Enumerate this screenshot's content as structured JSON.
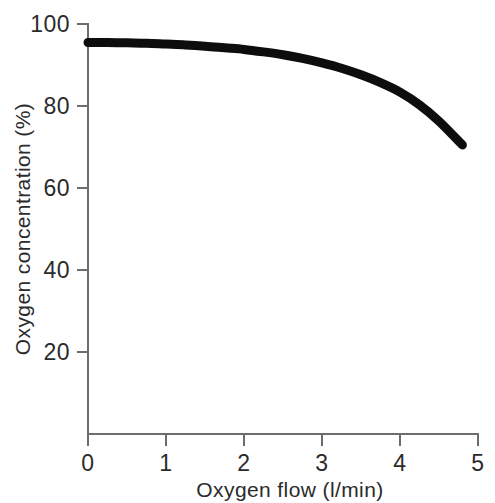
{
  "figure": {
    "background_color": "#ffffff",
    "axis_color": "#6d6d6d",
    "curve_color": "#0d0d0d"
  },
  "chart_data": {
    "type": "line",
    "title": "",
    "subtitle": "",
    "xlabel": "Oxygen flow (l/min)",
    "ylabel": "Oxygen concentration (%)",
    "xlim": [
      0,
      5
    ],
    "ylim": [
      0,
      100
    ],
    "xticks": [
      0,
      1,
      2,
      3,
      4,
      5
    ],
    "xtick_labels": [
      "0",
      "1",
      "2",
      "3",
      "4",
      "5"
    ],
    "yticks": [
      20,
      40,
      60,
      80,
      100
    ],
    "ytick_labels": [
      "20",
      "40",
      "60",
      "80",
      "100"
    ],
    "grid": false,
    "legend": null,
    "legend_position": "none",
    "annotations": [],
    "series": [
      {
        "name": "Oxygen concentration vs flow",
        "x": [
          0.0,
          0.25,
          0.5,
          0.75,
          1.0,
          1.25,
          1.5,
          1.75,
          2.0,
          2.25,
          2.5,
          2.75,
          3.0,
          3.25,
          3.5,
          3.75,
          4.0,
          4.25,
          4.5,
          4.8
        ],
        "values": [
          95.5,
          95.5,
          95.4,
          95.3,
          95.1,
          94.9,
          94.6,
          94.2,
          93.8,
          93.2,
          92.5,
          91.6,
          90.5,
          89.2,
          87.6,
          85.7,
          83.4,
          80.3,
          76.3,
          70.5
        ]
      }
    ]
  }
}
